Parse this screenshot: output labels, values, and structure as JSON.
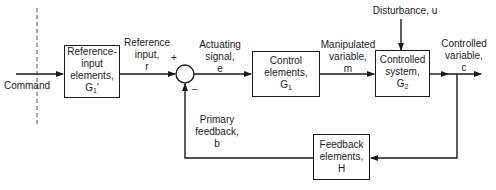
{
  "diagram": {
    "type": "block-diagram",
    "topic": "Closed-loop feedback control system",
    "input": {
      "label": "Command"
    },
    "blocks": [
      {
        "id": "ref",
        "line1": "Reference-",
        "line2": "input",
        "line3": "elements,",
        "symbol": "G",
        "sub": "1",
        "suffix": "'"
      },
      {
        "id": "control",
        "line1": "Control",
        "line2": "elements,",
        "symbol": "G",
        "sub": "1"
      },
      {
        "id": "plant",
        "line1": "Controlled",
        "line2": "system,",
        "symbol": "G",
        "sub": "2"
      },
      {
        "id": "feedback",
        "line1": "Feedback",
        "line2": "elements,",
        "symbol": "H"
      }
    ],
    "summing_junction": {
      "plus": "+",
      "minus": "−"
    },
    "signals": {
      "reference": {
        "line1": "Reference",
        "line2": "input,",
        "line3": "r"
      },
      "actuating": {
        "line1": "Actuating",
        "line2": "signal,",
        "line3": "e"
      },
      "manipulated": {
        "line1": "Manipulated",
        "line2": "variable,",
        "line3": "m"
      },
      "disturbance": {
        "text": "Disturbance, u"
      },
      "controlled": {
        "line1": "Controlled",
        "line2": "variable,",
        "line3": "c"
      },
      "feedback": {
        "line1": "Primary",
        "line2": "feedback,",
        "line3": "b"
      }
    }
  }
}
